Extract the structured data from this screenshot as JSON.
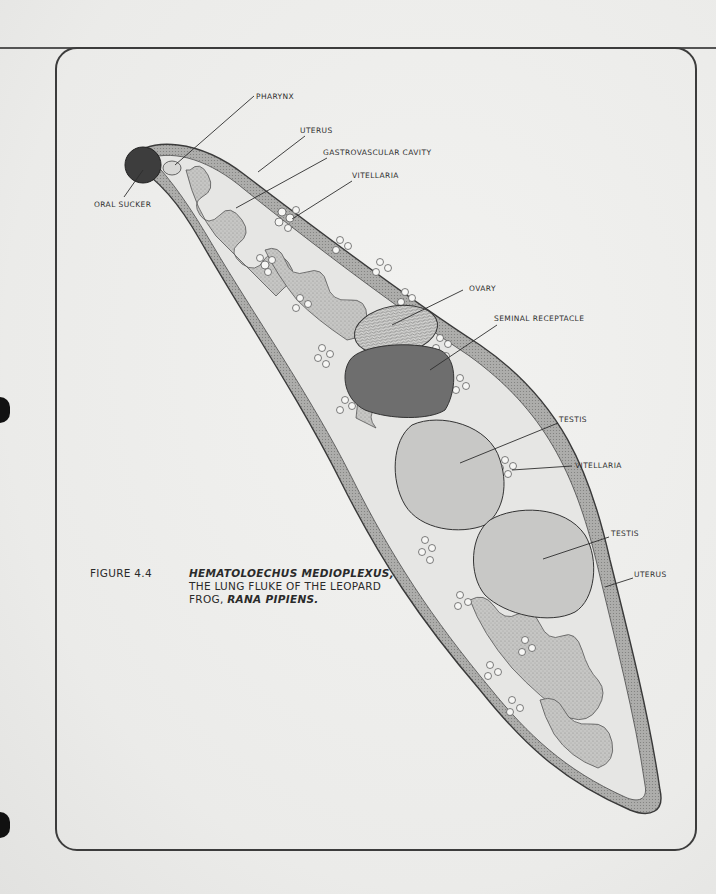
{
  "page": {
    "bleed_through_text": [
      "",
      ""
    ],
    "background_color": "#eeeeec",
    "ink_color": "#2e2e2e"
  },
  "figure": {
    "number_label": "FIGURE 4.4",
    "caption_line1_italic": "HEMATOLOECHUS MEDIOPLEXUS,",
    "caption_line2": "THE LUNG FLUKE OF THE LEOPARD",
    "caption_line3_prefix": "FROG, ",
    "caption_line3_italic": "RANA PIPIENS.",
    "labels": {
      "pharynx": "PHARYNX",
      "oral_sucker": "ORAL SUCKER",
      "uterus_top": "UTERUS",
      "gastrovascular_cavity": "GASTROVASCULAR CAVITY",
      "vitellaria_top": "VITELLARIA",
      "ovary": "OVARY",
      "seminal_receptacle": "SEMINAL RECEPTACLE",
      "testis_1": "TESTIS",
      "vitellaria_mid": "VITELLARIA",
      "testis_2": "TESTIS",
      "uterus_bottom": "UTERUS"
    },
    "colors": {
      "oral_sucker": "#3d3d3d",
      "seminal_receptacle": "#6e6e6e",
      "testis": "#c8c8c6",
      "ovary": "#b9b9b7",
      "body_wall": "#a9a9a7",
      "uterus": "#c4c4c2",
      "vitellaria": "#f3f3f1"
    }
  }
}
